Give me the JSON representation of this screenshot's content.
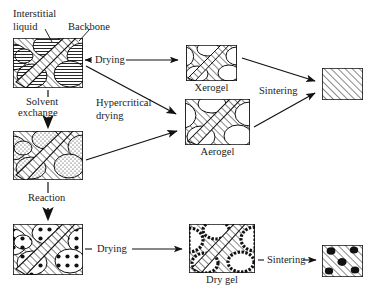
{
  "figure": {
    "type": "process-flow-diagram",
    "background": "#ffffff",
    "ink": "#111111"
  },
  "callout_labels": {
    "interstitial_liquid_line1": "Interstitial",
    "interstitial_liquid_line2": "liquid",
    "backbone": "Backbone"
  },
  "process_labels": {
    "drying_top": "Drying",
    "solvent_exchange_line1": "Solvent",
    "solvent_exchange_line2": "exchange",
    "hypercritical_line1": "Hypercritical",
    "hypercritical_line2": "drying",
    "reaction": "Reaction",
    "sintering_top": "Sintering",
    "drying_bottom": "Drying",
    "sintering_bottom": "Sintering"
  },
  "structures": [
    {
      "id": "wet-gel",
      "caption": "",
      "pore_fill": "horizontal-lines",
      "backbone_fill": "diagonal-hatch",
      "x": 13,
      "y": 38,
      "w": 70,
      "h": 50
    },
    {
      "id": "solvent-exchanged-gel",
      "caption": "",
      "pore_fill": "stipple",
      "backbone_fill": "diagonal-hatch",
      "x": 13,
      "y": 131,
      "w": 70,
      "h": 49
    },
    {
      "id": "reacted-gel",
      "caption": "",
      "pore_fill": "coarse-dots",
      "backbone_fill": "diagonal-hatch",
      "x": 13,
      "y": 224,
      "w": 70,
      "h": 51
    },
    {
      "id": "xerogel",
      "caption": "Xerogel",
      "pore_fill": "empty",
      "backbone_fill": "diagonal-hatch",
      "x": 186,
      "y": 45,
      "w": 51,
      "h": 36
    },
    {
      "id": "aerogel",
      "caption": "Aerogel",
      "pore_fill": "empty",
      "backbone_fill": "diagonal-hatch",
      "x": 185,
      "y": 99,
      "w": 65,
      "h": 46
    },
    {
      "id": "sintered-dense",
      "caption": "",
      "pore_fill": "none",
      "backbone_fill": "diagonal-hatch",
      "x": 322,
      "y": 68,
      "w": 41,
      "h": 32
    },
    {
      "id": "dry-gel",
      "caption": "Dry gel",
      "pore_fill": "empty-rough-black-rim",
      "backbone_fill": "diagonal-hatch",
      "x": 189,
      "y": 224,
      "w": 66,
      "h": 49
    },
    {
      "id": "sintered-with-inclusions",
      "caption": "",
      "pore_fill": "black-blobs",
      "backbone_fill": "diagonal-hatch",
      "x": 322,
      "y": 245,
      "w": 41,
      "h": 32
    }
  ],
  "arrows": [
    {
      "from": "wet-gel",
      "to": "xerogel",
      "label": "Drying",
      "style": "horizontal double-headed stub"
    },
    {
      "from": "wet-gel",
      "to": "solvent-exchanged-gel",
      "label": "Solvent exchange",
      "style": "vertical"
    },
    {
      "from": "wet-gel",
      "to": "aerogel",
      "label": "Hypercritical drying",
      "style": "diagonal"
    },
    {
      "from": "solvent-exchanged-gel",
      "to": "aerogel",
      "label": "",
      "style": "diagonal"
    },
    {
      "from": "solvent-exchanged-gel",
      "to": "reacted-gel",
      "label": "Reaction",
      "style": "vertical"
    },
    {
      "from": "xerogel",
      "to": "sintered-dense",
      "label": "Sintering",
      "style": "diagonal"
    },
    {
      "from": "aerogel",
      "to": "sintered-dense",
      "label": "Sintering",
      "style": "diagonal"
    },
    {
      "from": "reacted-gel",
      "to": "dry-gel",
      "label": "Drying",
      "style": "horizontal"
    },
    {
      "from": "dry-gel",
      "to": "sintered-with-inclusions",
      "label": "Sintering",
      "style": "horizontal short"
    }
  ]
}
